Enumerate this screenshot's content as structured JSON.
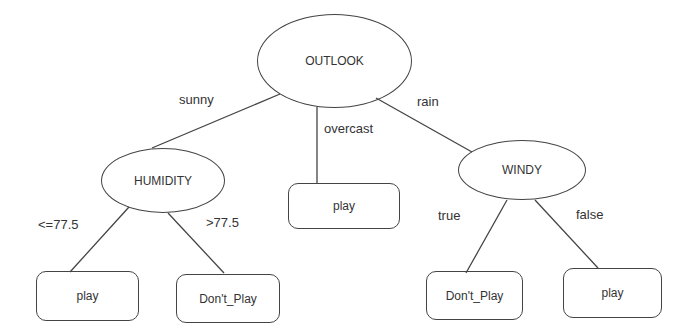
{
  "tree": {
    "root": {
      "label": "OUTLOOK"
    },
    "internal": [
      {
        "label": "HUMIDITY"
      },
      {
        "label": "WINDY"
      }
    ],
    "leaves": [
      {
        "label": "play"
      },
      {
        "label": "Don't_Play"
      },
      {
        "label": "play"
      },
      {
        "label": "Don't_Play"
      },
      {
        "label": "play"
      }
    ],
    "edges": [
      {
        "label": "sunny"
      },
      {
        "label": "overcast"
      },
      {
        "label": "rain"
      },
      {
        "label": "<=77.5"
      },
      {
        "label": ">77.5"
      },
      {
        "label": "true"
      },
      {
        "label": "false"
      }
    ]
  },
  "colors": {
    "stroke": "#444444",
    "text": "#333333",
    "background": "#ffffff"
  }
}
